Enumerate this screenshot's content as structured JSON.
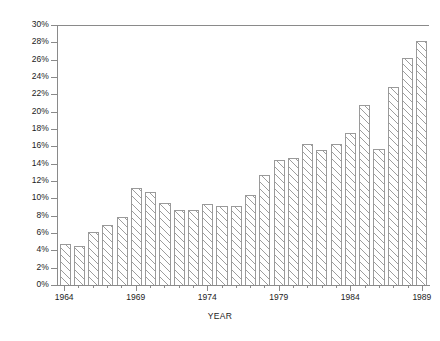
{
  "chart_data": {
    "type": "bar",
    "title": "",
    "xlabel": "YEAR",
    "ylabel": "",
    "ylim": [
      0,
      30
    ],
    "ytick_step": 2,
    "grid": false,
    "legend": null,
    "yticks": [
      "0%",
      "2%",
      "4%",
      "6%",
      "8%",
      "10%",
      "12%",
      "14%",
      "16%",
      "18%",
      "20%",
      "22%",
      "24%",
      "26%",
      "28%",
      "30%"
    ],
    "xticks_labeled": [
      "1964",
      "1969",
      "1974",
      "1979",
      "1984",
      "1989"
    ],
    "categories": [
      "1964",
      "1965",
      "1966",
      "1967",
      "1968",
      "1969",
      "1970",
      "1971",
      "1972",
      "1973",
      "1974",
      "1975",
      "1976",
      "1977",
      "1978",
      "1979",
      "1980",
      "1981",
      "1982",
      "1983",
      "1984",
      "1985",
      "1986",
      "1987",
      "1988",
      "1989"
    ],
    "values": [
      4.7,
      4.5,
      6.1,
      7.0,
      7.9,
      11.2,
      10.8,
      9.5,
      8.7,
      8.7,
      9.4,
      9.1,
      9.2,
      10.4,
      12.8,
      14.5,
      14.7,
      16.3,
      15.6,
      16.3,
      17.6,
      20.8,
      15.8,
      22.9,
      26.3,
      28.3
    ],
    "unit": "%"
  },
  "axis": {
    "x_title": "YEAR"
  }
}
